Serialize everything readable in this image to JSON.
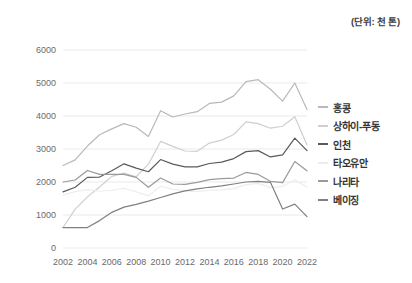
{
  "unit_note": "(단위: 천 톤)",
  "legend": {
    "position": "right",
    "entries": [
      {
        "label": "홍콩",
        "color": "#b9b9b9"
      },
      {
        "label": "상하이-푸동",
        "color": "#cfcfcf"
      },
      {
        "label": "인천",
        "color": "#5a5a5a"
      },
      {
        "label": "타오유안",
        "color": "#ededed"
      },
      {
        "label": "나리타",
        "color": "#9a9a9a"
      },
      {
        "label": "베이징",
        "color": "#808080"
      }
    ]
  },
  "axes": {
    "y_ticks": [
      "0",
      "1000",
      "2000",
      "3000",
      "4000",
      "5000",
      "6000"
    ],
    "x_ticks": [
      "2002",
      "2004",
      "2006",
      "2008",
      "2010",
      "2012",
      "2014",
      "2016",
      "2018",
      "2020",
      "2022"
    ],
    "grid": "horizontal"
  },
  "chart_data": {
    "type": "line",
    "title": "",
    "subtitle": "",
    "xlabel": "",
    "ylabel": "",
    "unit": "(단위: 천 톤)",
    "ylim": [
      0,
      6000
    ],
    "ytick_values": [
      0,
      1000,
      2000,
      3000,
      4000,
      5000,
      6000
    ],
    "xtick_values": [
      2002,
      2004,
      2006,
      2008,
      2010,
      2012,
      2014,
      2016,
      2018,
      2020,
      2022
    ],
    "grid": "horizontal",
    "legend_position": "right",
    "x": [
      2002,
      2003,
      2004,
      2005,
      2006,
      2007,
      2008,
      2009,
      2010,
      2011,
      2012,
      2013,
      2014,
      2015,
      2016,
      2017,
      2018,
      2019,
      2020,
      2021,
      2022
    ],
    "series": [
      {
        "name": "홍콩",
        "color": "#b9b9b9",
        "values": [
          2500,
          2670,
          3090,
          3430,
          3610,
          3770,
          3660,
          3380,
          4160,
          3970,
          4060,
          4130,
          4380,
          4420,
          4610,
          5040,
          5100,
          4810,
          4450,
          5000,
          4200
        ]
      },
      {
        "name": "상하이-푸동",
        "color": "#cfcfcf",
        "values": [
          620,
          1180,
          1550,
          1850,
          2170,
          2270,
          2160,
          2540,
          3230,
          3080,
          2940,
          2930,
          3180,
          3270,
          3440,
          3820,
          3770,
          3630,
          3690,
          3980,
          3120
        ]
      },
      {
        "name": "인천",
        "color": "#5a5a5a",
        "values": [
          1700,
          1840,
          2140,
          2150,
          2340,
          2550,
          2420,
          2310,
          2680,
          2540,
          2460,
          2460,
          2560,
          2600,
          2710,
          2920,
          2950,
          2760,
          2820,
          3330,
          2950
        ]
      },
      {
        "name": "타오유안",
        "color": "#ededed",
        "values": [
          1600,
          1710,
          1770,
          1720,
          1750,
          1810,
          1700,
          1580,
          1870,
          1780,
          1730,
          1710,
          1750,
          1760,
          1800,
          1920,
          1960,
          1830,
          1870,
          2070,
          1840
        ]
      },
      {
        "name": "나리타",
        "color": "#9a9a9a",
        "values": [
          2000,
          2060,
          2350,
          2230,
          2230,
          2230,
          2140,
          1840,
          2120,
          1940,
          1930,
          1990,
          2070,
          2100,
          2120,
          2290,
          2230,
          2020,
          1980,
          2620,
          2340
        ]
      },
      {
        "name": "베이징",
        "color": "#808080",
        "values": [
          620,
          620,
          620,
          830,
          1080,
          1240,
          1320,
          1420,
          1530,
          1640,
          1730,
          1790,
          1840,
          1880,
          1940,
          2000,
          2020,
          1990,
          1180,
          1330,
          950
        ]
      }
    ]
  }
}
